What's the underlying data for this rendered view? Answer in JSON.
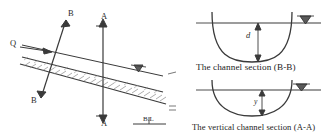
{
  "figure": {
    "ink_color": "#3a3a3a",
    "text_color": "#2b2b2b"
  },
  "plan_view": {
    "discharge_label": "Q",
    "section_line_b_top_label": "B",
    "section_line_b_bottom_label": "B",
    "section_line_a_top_label": "A",
    "section_line_a_bottom_label": "A",
    "bed_label": "B.L",
    "water_surface_symbol": "water-level-triangle",
    "flow_arrow_symbol": "flow-arrow"
  },
  "section_bb": {
    "caption": "The channel section (B-B)",
    "depth_label": "d",
    "water_surface_symbol": "water-level-triangle"
  },
  "section_aa": {
    "caption": "The vertical channel section (A-A)",
    "depth_label": "y",
    "water_surface_symbol": "water-level-triangle"
  }
}
